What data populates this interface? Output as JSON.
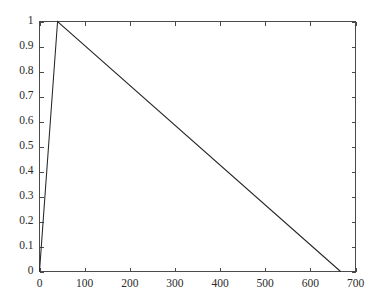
{
  "chart_data": {
    "type": "line",
    "title": "",
    "subtitle": "",
    "xlabel": "",
    "ylabel": "",
    "xlim": [
      0,
      700
    ],
    "ylim": [
      0,
      1
    ],
    "grid": false,
    "legend": null,
    "legend_position": "none",
    "xticks": [
      0,
      100,
      200,
      300,
      400,
      500,
      600,
      700
    ],
    "xticklabels": [
      "0",
      "100",
      "200",
      "300",
      "400",
      "500",
      "600",
      "700"
    ],
    "yticks": [
      0,
      0.1,
      0.2,
      0.3,
      0.4,
      0.5,
      0.6,
      0.7,
      0.8,
      0.9,
      1
    ],
    "yticklabels": [
      "0",
      "0.1",
      "0.2",
      "0.3",
      "0.4",
      "0.5",
      "0.6",
      "0.7",
      "0.8",
      "0.9",
      "1"
    ],
    "series": [
      {
        "name": "signal",
        "color": "#262626",
        "x": [
          0,
          40,
          667
        ],
        "values": [
          0,
          1,
          0
        ],
        "points": [
          {
            "x": 0,
            "y": 0
          },
          {
            "x": 40,
            "y": 1
          },
          {
            "x": 667,
            "y": 0
          }
        ]
      }
    ],
    "annotations": []
  },
  "figure": {
    "background_color": "#ffffff",
    "axis_color": "#4a4a4a",
    "line_color": "#262626",
    "tick_direction": "in",
    "box": true
  }
}
